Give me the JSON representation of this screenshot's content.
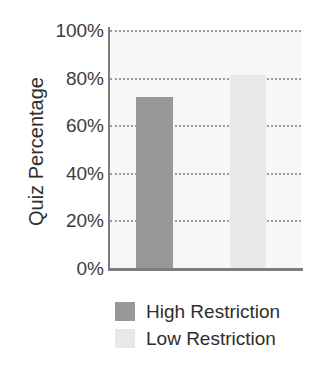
{
  "chart_data": {
    "type": "bar",
    "title": "",
    "subtitle": "",
    "xlabel": "",
    "ylabel": "Quiz Percentage",
    "categories": [
      "High Restriction",
      "Low Restriction"
    ],
    "values": [
      72,
      81
    ],
    "value_labels": [
      "72%",
      "81%"
    ],
    "ylim": [
      0,
      100
    ],
    "y_ticks": [
      0,
      20,
      40,
      60,
      80,
      100
    ],
    "y_tick_labels": [
      "0%",
      "20%",
      "40%",
      "60%",
      "80%",
      "100%"
    ],
    "grid": "horizontal-dotted",
    "legend_position": "bottom-left",
    "series": [
      {
        "name": "High Restriction",
        "value": 72,
        "color": "#989898"
      },
      {
        "name": "Low Restriction",
        "value": 81,
        "color": "#e8e8e8"
      }
    ]
  },
  "axis": {
    "y_title": "Quiz Percentage",
    "ticks": [
      {
        "label": "100%",
        "value": 100
      },
      {
        "label": "80%",
        "value": 80
      },
      {
        "label": "60%",
        "value": 60
      },
      {
        "label": "40%",
        "value": 40
      },
      {
        "label": "20%",
        "value": 20
      },
      {
        "label": "0%",
        "value": 0
      }
    ]
  },
  "legend": {
    "items": [
      {
        "label": "High Restriction",
        "color": "#989898"
      },
      {
        "label": "Low Restriction",
        "color": "#e8e8e8"
      }
    ]
  },
  "colors": {
    "plot_background": "#f7f7f7",
    "axis_line": "#7d7d7d",
    "gridline": "#9b9b9b",
    "text": "#2e2e2e",
    "high_restriction": "#989898",
    "low_restriction": "#e8e8e8"
  }
}
